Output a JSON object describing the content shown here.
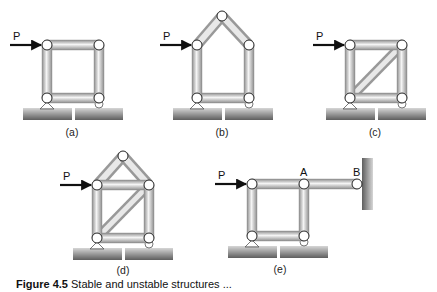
{
  "figure": {
    "caption_number": "Figure 4.5",
    "caption_text": "Stable and unstable structures ...",
    "colors": {
      "member_fill_light": "#f2f2f2",
      "member_fill_dark": "#9a9a9a",
      "ground_light": "#cfcfcf",
      "ground_dark": "#6a6a6a",
      "arrow": "#111111",
      "joint_fill": "#ffffff"
    }
  },
  "panels": [
    {
      "id": "a",
      "label": "(a)",
      "load_label": "P",
      "description": "square frame, four pins, no diagonal"
    },
    {
      "id": "b",
      "label": "(b)",
      "load_label": "P",
      "description": "pentagon frame (house shape)"
    },
    {
      "id": "c",
      "label": "(c)",
      "load_label": "P",
      "description": "square frame with diagonal"
    },
    {
      "id": "d",
      "label": "(d)",
      "load_label": "P",
      "description": "house frame with diagonal and horizontal tie"
    },
    {
      "id": "e",
      "label": "(e)",
      "load_label": "P",
      "description": "square frame with extended member A-B pinned to wall",
      "point_labels": [
        "A",
        "B"
      ]
    }
  ]
}
